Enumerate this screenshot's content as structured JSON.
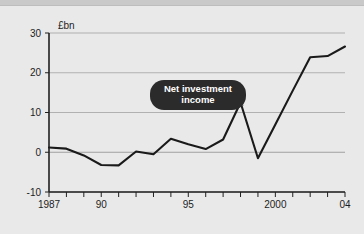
{
  "chart_data": {
    "type": "line",
    "title": "",
    "subtitle": "",
    "unit_label": "£bn",
    "xlabel": "",
    "ylabel": "",
    "ylim": [
      -10,
      30
    ],
    "xlim": [
      1987,
      2004
    ],
    "yticks": [
      30,
      20,
      10,
      0,
      -10
    ],
    "ytick_labels": [
      "30",
      "20",
      "10",
      "0",
      "-10"
    ],
    "xticks": [
      1987,
      1988,
      1989,
      1990,
      1991,
      1992,
      1993,
      1994,
      1995,
      1996,
      1997,
      1998,
      1999,
      2000,
      2001,
      2002,
      2003,
      2004
    ],
    "xtick_labels_shown": [
      {
        "x": 1987,
        "label": "1987"
      },
      {
        "x": 1990,
        "label": "90"
      },
      {
        "x": 1995,
        "label": "95"
      },
      {
        "x": 2000,
        "label": "2000"
      },
      {
        "x": 2004,
        "label": "04"
      }
    ],
    "grid": true,
    "legend": "none",
    "series": [
      {
        "name": "Net investment income",
        "color": "#1a1a1a",
        "x": [
          1987,
          1988,
          1989,
          1990,
          1991,
          1992,
          1993,
          1994,
          1995,
          1996,
          1997,
          1998,
          1999,
          2000,
          2001,
          2002,
          2003,
          2004
        ],
        "values": [
          1.2,
          0.9,
          -0.8,
          -3.2,
          -3.3,
          0.2,
          -0.5,
          3.4,
          2.0,
          0.8,
          3.2,
          12.5,
          -1.5,
          7.0,
          15.5,
          23.9,
          24.2,
          26.6
        ]
      }
    ],
    "annotations": [
      {
        "name": "net-investment-income-callout",
        "text_line_1": "Net investment",
        "text_line_2": "income",
        "background_color": "#2b2b2b",
        "text_color": "#ffffff",
        "points_to_x": 1998,
        "points_to_y": 12.5
      }
    ],
    "colors": {
      "background": "#e9e9e9",
      "top_strip": "#c9c9c9",
      "axis": "#202020",
      "gridline": "#9a9a9a",
      "line": "#1a1a1a"
    }
  }
}
